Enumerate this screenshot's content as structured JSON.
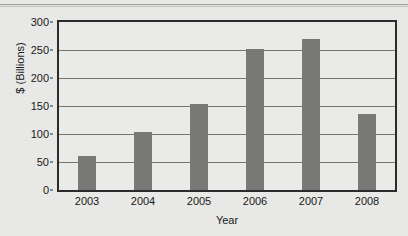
{
  "chart_data": {
    "type": "bar",
    "title": "",
    "categories": [
      "2003",
      "2004",
      "2005",
      "2006",
      "2007",
      "2008"
    ],
    "values": [
      60,
      103,
      153,
      251,
      270,
      135
    ],
    "series": [
      {
        "name": "",
        "values": [
          60,
          103,
          153,
          251,
          270,
          135
        ]
      }
    ],
    "xlabel": "Year",
    "ylabel": "$ (Billions)",
    "ylim": [
      0,
      300
    ],
    "yticks": [
      0,
      50,
      100,
      150,
      200,
      250,
      300
    ],
    "ytick_labels": [
      "0",
      "50",
      "100",
      "150",
      "200",
      "250",
      "300"
    ],
    "grid": true,
    "grid_axis": "y",
    "legend": false,
    "legend_position": "none",
    "bar_color": "#787876",
    "plot_background": "#eaeae8",
    "figure_background": "#e8e8e6",
    "axis_color": "#2b2b2b",
    "gridline_color": "#77776f"
  }
}
